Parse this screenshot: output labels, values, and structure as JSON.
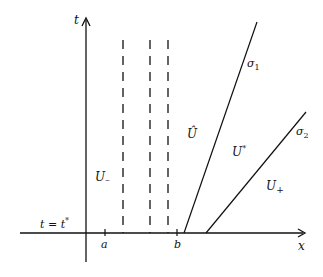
{
  "diagram": {
    "axes": {
      "t_label": "t",
      "x_label": "x",
      "time_line_label": "t = t*"
    },
    "ticks": {
      "a": "a",
      "b": "b"
    },
    "regions": {
      "u_minus": "U_",
      "u_hat": "Û",
      "u_star": "U*",
      "u_plus": "U+"
    },
    "waves": {
      "sigma1": "σ1",
      "sigma2": "σ2"
    },
    "colors": {
      "ink": "#111111",
      "background": "#ffffff"
    }
  }
}
